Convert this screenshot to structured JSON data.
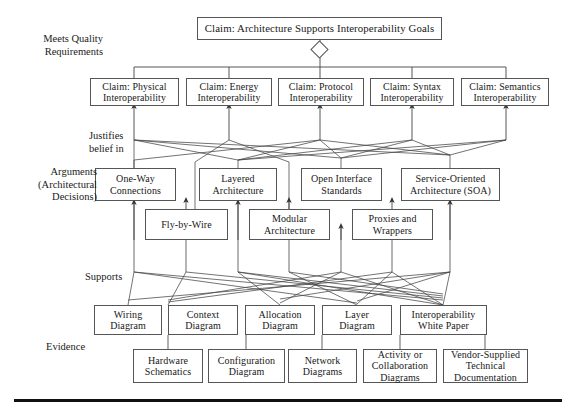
{
  "figure": {
    "title_top": "Claim: Architecture Supports Interoperability Goals",
    "row_labels": {
      "quality": "Meets Quality\nRequirements",
      "justifies": "Justifies\nbelief in",
      "arguments": "Arguments\n(Architectural\nDecisions)",
      "supports": "Supports",
      "evidence": "Evidence"
    },
    "claims": [
      "Claim: Physical\nInteroperability",
      "Claim: Energy\nInteroperability",
      "Claim: Protocol\nInteroperability",
      "Claim: Syntax\nInteroperability",
      "Claim: Semantics\nInteroperability"
    ],
    "arguments_row1": [
      "One-Way\nConnections",
      "Layered\nArchitecture",
      "Open Interface\nStandards",
      "Service-Oriented\nArchitecture (SOA)"
    ],
    "arguments_row2": [
      "Fly-by-Wire",
      "Modular\nArchitecture",
      "Proxies and\nWrappers"
    ],
    "evidence_row1": [
      "Wiring\nDiagram",
      "Context\nDiagram",
      "Allocation\nDiagram",
      "Layer\nDiagram",
      "Interoperability\nWhite Paper"
    ],
    "evidence_row2": [
      "Hardware\nSchematics",
      "Configuration\nDiagram",
      "Network\nDiagrams",
      "Activity or\nCollaboration\nDiagrams",
      "Vendor-Supplied\nTechnical\nDocumentation"
    ],
    "colors": {
      "box_border": "#555555",
      "box_fill": "#ffffff",
      "line": "#444444",
      "text": "#181818",
      "rule": "#111111"
    }
  }
}
